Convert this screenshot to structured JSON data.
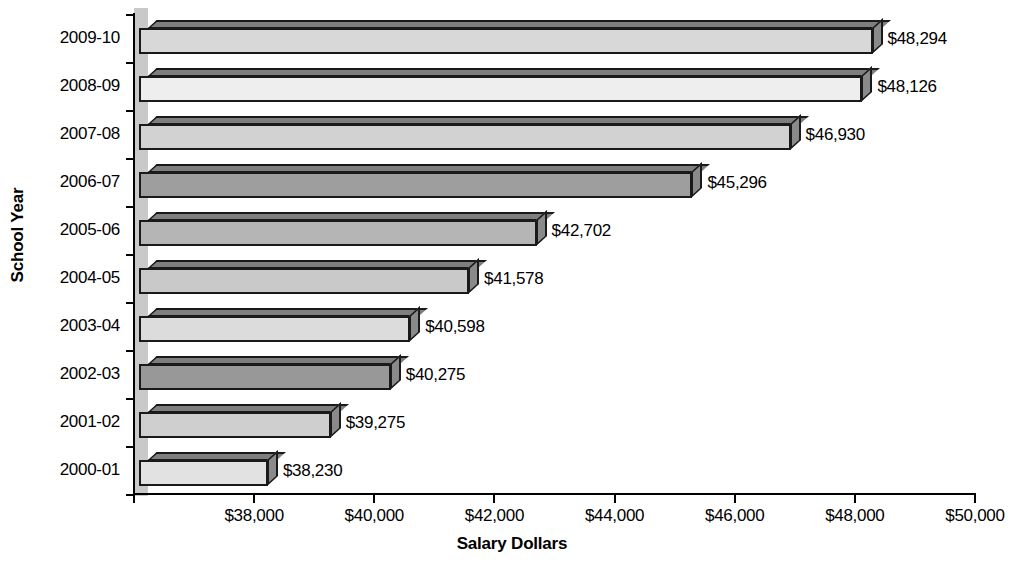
{
  "chart_data": {
    "type": "bar",
    "orientation": "horizontal",
    "title": "",
    "xlabel": "Salary Dollars",
    "ylabel": "School Year",
    "xlim": [
      36000,
      50000
    ],
    "xticks": [
      36000,
      38000,
      40000,
      42000,
      44000,
      46000,
      48000,
      50000
    ],
    "xtick_labels": [
      "",
      "$38,000",
      "$40,000",
      "$42,000",
      "$44,000",
      "$46,000",
      "$48,000",
      "$50,000"
    ],
    "grid": false,
    "legend": null,
    "categories": [
      "2009-10",
      "2008-09",
      "2007-08",
      "2006-07",
      "2005-06",
      "2004-05",
      "2003-04",
      "2002-03",
      "2001-02",
      "2000-01"
    ],
    "values": [
      48294,
      48126,
      46930,
      45296,
      42702,
      41578,
      40598,
      40275,
      39275,
      38230
    ],
    "value_labels": [
      "$48,294",
      "$48,126",
      "$46,930",
      "$45,296",
      "$42,702",
      "$41,578",
      "$40,598",
      "$40,275",
      "$39,275",
      "$38,230"
    ],
    "bar_colors": [
      "#d8d8d8",
      "#eeeeee",
      "#d2d2d2",
      "#9e9e9e",
      "#b5b5b5",
      "#c9c9c9",
      "#dcdcdc",
      "#989898",
      "#cfcfcf",
      "#e2e2e2"
    ]
  },
  "axes": {
    "y_title": "School Year",
    "x_title": "Salary Dollars"
  },
  "bars": [
    {
      "category": "2009-10",
      "value": 48294,
      "label": "$48,294",
      "color": "#d8d8d8"
    },
    {
      "category": "2008-09",
      "value": 48126,
      "label": "$48,126",
      "color": "#eeeeee"
    },
    {
      "category": "2007-08",
      "value": 46930,
      "label": "$46,930",
      "color": "#d2d2d2"
    },
    {
      "category": "2006-07",
      "value": 45296,
      "label": "$45,296",
      "color": "#9e9e9e"
    },
    {
      "category": "2005-06",
      "value": 42702,
      "label": "$42,702",
      "color": "#b5b5b5"
    },
    {
      "category": "2004-05",
      "value": 41578,
      "label": "$41,578",
      "color": "#c9c9c9"
    },
    {
      "category": "2003-04",
      "value": 40598,
      "label": "$40,598",
      "color": "#dcdcdc"
    },
    {
      "category": "2002-03",
      "value": 40275,
      "label": "$40,275",
      "color": "#989898"
    },
    {
      "category": "2001-02",
      "value": 39275,
      "label": "$39,275",
      "color": "#cfcfcf"
    },
    {
      "category": "2000-01",
      "value": 38230,
      "label": "$38,230",
      "color": "#e2e2e2"
    }
  ],
  "x_axis_ticks": [
    {
      "value": 36000,
      "label": ""
    },
    {
      "value": 38000,
      "label": "$38,000"
    },
    {
      "value": 40000,
      "label": "$40,000"
    },
    {
      "value": 42000,
      "label": "$42,000"
    },
    {
      "value": 44000,
      "label": "$44,000"
    },
    {
      "value": 46000,
      "label": "$46,000"
    },
    {
      "value": 48000,
      "label": "$48,000"
    },
    {
      "value": 50000,
      "label": "$50,000"
    }
  ]
}
